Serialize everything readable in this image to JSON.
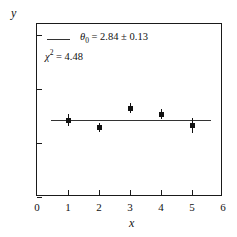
{
  "chart_data": {
    "type": "scatter",
    "title": "",
    "xlabel": "x",
    "ylabel": "y",
    "xlim": [
      0,
      6
    ],
    "ylim": [
      0,
      6.4
    ],
    "xticks": [
      "0",
      "1",
      "2",
      "3",
      "4",
      "5",
      "6"
    ],
    "xtick_values": [
      0,
      1,
      2,
      3,
      4,
      5,
      6
    ],
    "yticks": [
      "0",
      "2",
      "4",
      "6"
    ],
    "ytick_values": [
      0,
      2,
      4,
      6
    ],
    "grid": false,
    "legend_position": "upper-left",
    "x": [
      1,
      2,
      3,
      4,
      5
    ],
    "values": [
      2.85,
      2.58,
      3.3,
      3.07,
      2.65
    ],
    "yerr": [
      0.22,
      0.16,
      0.18,
      0.2,
      0.28
    ],
    "series": [
      {
        "name": "data",
        "x": [
          1,
          2,
          3,
          4,
          5
        ],
        "values": [
          2.85,
          2.58,
          3.3,
          3.07,
          2.65
        ],
        "yerr": [
          0.22,
          0.16,
          0.18,
          0.2,
          0.28
        ],
        "marker": "square",
        "color": "#111111"
      },
      {
        "name": "fit",
        "type": "line",
        "constant_value": 2.84,
        "x_start": 0.45,
        "x_end": 5.6,
        "color": "#333333"
      }
    ],
    "annotations": [
      {
        "name": "theta-fit",
        "parameter": "θ",
        "subscript": "0",
        "value": "2.84",
        "uncertainty": "0.13",
        "text": "θ₀ = 2.84 ± 0.13"
      },
      {
        "name": "chi-squared",
        "parameter": "χ",
        "superscript": "2",
        "value": "4.48",
        "text": "χ² = 4.48"
      }
    ]
  },
  "axes": {
    "ylabel": "y",
    "xlabel": "x",
    "ytick_labels": [
      "0",
      "2",
      "4",
      "6"
    ],
    "xtick_labels": [
      "0",
      "1",
      "2",
      "3",
      "4",
      "5",
      "6"
    ]
  },
  "legend": {
    "theta_symbol": "θ",
    "theta_sub": "0",
    "theta_eq": " = 2.84 ± 0.13",
    "chi_symbol": "χ",
    "chi_sup": "2",
    "chi_eq": " = 4.48"
  },
  "colors": {
    "axis": "#1a1a1a",
    "marker": "#111111",
    "fit_line": "#333333",
    "background": "#ffffff"
  }
}
